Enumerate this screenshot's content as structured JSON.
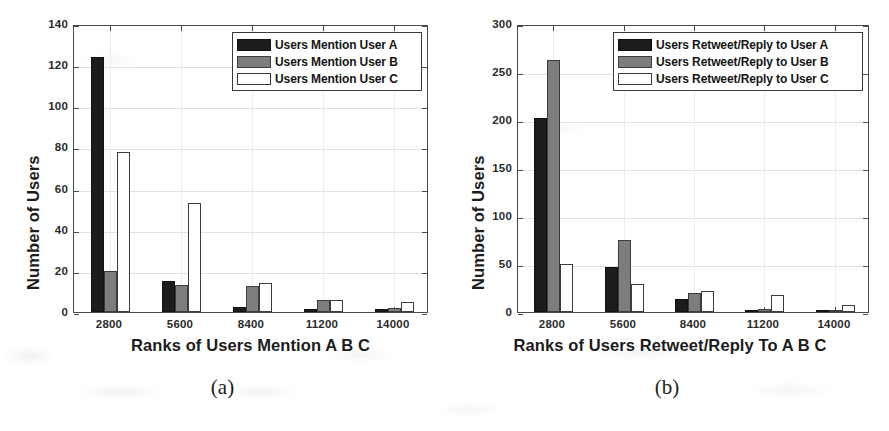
{
  "figures": [
    {
      "id": "a",
      "caption": "(a)",
      "chart_data": {
        "type": "bar",
        "title": "",
        "xlabel": "Ranks of Users Mention A B C",
        "ylabel": "Number of Users",
        "categories": [
          "2800",
          "5600",
          "8400",
          "11200",
          "14000"
        ],
        "ylim": [
          0,
          140
        ],
        "yticks": [
          0,
          20,
          40,
          60,
          80,
          100,
          120,
          140
        ],
        "grid": true,
        "legend_position": "top-right",
        "series": [
          {
            "name": "Users Mention User A",
            "color": "#1c1c1c",
            "fill": "black",
            "values": [
              124,
              15,
              2.5,
              1.5,
              1.5
            ]
          },
          {
            "name": "Users Mention User B",
            "color": "#7d7d7d",
            "fill": "gray",
            "values": [
              20,
              13,
              12.5,
              6,
              2
            ]
          },
          {
            "name": "Users Mention User C",
            "color": "#ffffff",
            "fill": "white",
            "values": [
              78,
              53,
              14,
              6,
              5
            ]
          }
        ]
      }
    },
    {
      "id": "b",
      "caption": "(b)",
      "chart_data": {
        "type": "bar",
        "title": "",
        "xlabel": "Ranks of Users Retweet/Reply To A B C",
        "ylabel": "Number of Users",
        "categories": [
          "2800",
          "5600",
          "8400",
          "11200",
          "14000"
        ],
        "ylim": [
          0,
          300
        ],
        "yticks": [
          0,
          50,
          100,
          150,
          200,
          250,
          300
        ],
        "grid": true,
        "legend_position": "top-right",
        "series": [
          {
            "name": "Users Retweet/Reply to User A",
            "color": "#1c1c1c",
            "fill": "black",
            "values": [
              202,
              47,
              14,
              2,
              1
            ]
          },
          {
            "name": "Users Retweet/Reply to User B",
            "color": "#7d7d7d",
            "fill": "gray",
            "values": [
              263,
              75,
              20,
              3,
              1.5
            ]
          },
          {
            "name": "Users Retweet/Reply to User C",
            "color": "#ffffff",
            "fill": "white",
            "values": [
              50,
              29,
              22,
              18,
              7
            ]
          }
        ]
      }
    }
  ]
}
